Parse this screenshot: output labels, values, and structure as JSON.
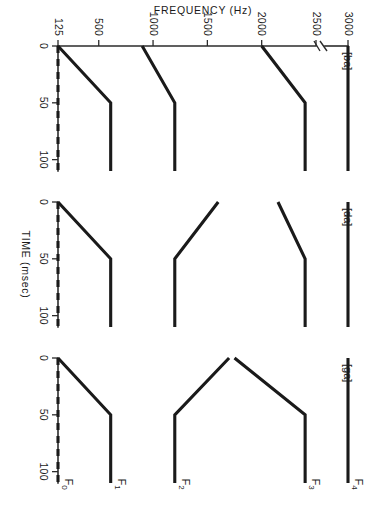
{
  "figure": {
    "orientation_deg": 90,
    "axis_titles": {
      "frequency": "FREQUENCY (Hz)",
      "time": "TIME (msec)"
    },
    "colors": {
      "ink": "#1a1a1a",
      "axis": "#2b2b2b",
      "background": "#ffffff"
    }
  },
  "axes": {
    "frequency": {
      "label": "FREQUENCY (Hz)",
      "unit": "Hz",
      "ticks": [
        125,
        500,
        1000,
        1500,
        2000,
        2500,
        3000
      ],
      "tick_labels": [
        "125",
        "500",
        "1000",
        "1500",
        "2000",
        "2500",
        "3000"
      ],
      "has_break": true,
      "break_between": [
        2500,
        3000
      ],
      "range": [
        125,
        3000
      ]
    },
    "time": {
      "label": "TIME (msec)",
      "unit": "msec",
      "ticks": [
        0,
        50,
        100
      ],
      "tick_labels": [
        "0",
        "50",
        "100"
      ],
      "range": [
        0,
        110
      ]
    }
  },
  "formant_labels": [
    {
      "name": "F0",
      "base": "F",
      "sub": "0"
    },
    {
      "name": "F1",
      "base": "F",
      "sub": "1"
    },
    {
      "name": "F2",
      "base": "F",
      "sub": "2"
    },
    {
      "name": "F3",
      "base": "F",
      "sub": "3"
    },
    {
      "name": "F4",
      "base": "F",
      "sub": "4"
    }
  ],
  "panels": [
    {
      "id": "ba",
      "label": "[ba]",
      "order": 1,
      "show_formant_labels": false,
      "traces": [
        {
          "formant": "F0",
          "style": "dashed",
          "points": [
            [
              0,
              125
            ],
            [
              110,
              125
            ]
          ]
        },
        {
          "formant": "F1",
          "style": "solid",
          "points": [
            [
              0,
              125
            ],
            [
              50,
              610
            ],
            [
              110,
              610
            ]
          ]
        },
        {
          "formant": "F2",
          "style": "solid",
          "points": [
            [
              0,
              900
            ],
            [
              50,
              1200
            ],
            [
              110,
              1200
            ]
          ]
        },
        {
          "formant": "F3",
          "style": "solid",
          "points": [
            [
              0,
              2000
            ],
            [
              50,
              2400
            ],
            [
              110,
              2400
            ]
          ]
        },
        {
          "formant": "F4",
          "style": "solid",
          "points": [
            [
              0,
              3000
            ],
            [
              110,
              3000
            ]
          ]
        }
      ]
    },
    {
      "id": "da",
      "label": "[da]",
      "order": 2,
      "show_formant_labels": false,
      "traces": [
        {
          "formant": "F0",
          "style": "dashed",
          "points": [
            [
              0,
              125
            ],
            [
              110,
              125
            ]
          ]
        },
        {
          "formant": "F1",
          "style": "solid",
          "points": [
            [
              0,
              125
            ],
            [
              50,
              610
            ],
            [
              110,
              610
            ]
          ]
        },
        {
          "formant": "F2",
          "style": "solid",
          "points": [
            [
              0,
              1600
            ],
            [
              50,
              1200
            ],
            [
              110,
              1200
            ]
          ]
        },
        {
          "formant": "F3",
          "style": "solid",
          "points": [
            [
              0,
              2150
            ],
            [
              50,
              2400
            ],
            [
              110,
              2400
            ]
          ]
        },
        {
          "formant": "F4",
          "style": "solid",
          "points": [
            [
              0,
              3000
            ],
            [
              110,
              3000
            ]
          ]
        }
      ]
    },
    {
      "id": "ga",
      "label": "[ga]",
      "order": 3,
      "show_formant_labels": true,
      "traces": [
        {
          "formant": "F0",
          "style": "dashed",
          "points": [
            [
              0,
              125
            ],
            [
              110,
              125
            ]
          ]
        },
        {
          "formant": "F1",
          "style": "solid",
          "points": [
            [
              0,
              125
            ],
            [
              50,
              610
            ],
            [
              110,
              610
            ]
          ]
        },
        {
          "formant": "F2",
          "style": "solid",
          "points": [
            [
              0,
              1700
            ],
            [
              50,
              1200
            ],
            [
              110,
              1200
            ]
          ]
        },
        {
          "formant": "F3",
          "style": "solid",
          "points": [
            [
              0,
              1750
            ],
            [
              50,
              2400
            ],
            [
              110,
              2400
            ]
          ]
        },
        {
          "formant": "F4",
          "style": "solid",
          "points": [
            [
              0,
              3000
            ],
            [
              110,
              3000
            ]
          ]
        }
      ]
    }
  ],
  "chart_data": {
    "type": "line",
    "title": "",
    "subtitle": "",
    "xlabel": "TIME (msec)",
    "ylabel": "FREQUENCY (Hz)",
    "xlim": [
      0,
      110
    ],
    "ylim": [
      125,
      3000
    ],
    "xticks": [
      0,
      50,
      100
    ],
    "yticks": [
      125,
      500,
      1000,
      1500,
      2000,
      2500,
      3000
    ],
    "grid": false,
    "legend": "none",
    "y_axis_break_between": [
      2500,
      3000
    ],
    "annotations": [
      "[ba]",
      "[da]",
      "[ga]",
      "F0",
      "F1",
      "F2",
      "F3",
      "F4"
    ],
    "panels": [
      {
        "name": "[ba]",
        "series": [
          {
            "name": "F0",
            "linestyle": "dashed",
            "x": [
              0,
              110
            ],
            "y": [
              125,
              125
            ]
          },
          {
            "name": "F1",
            "linestyle": "solid",
            "x": [
              0,
              50,
              110
            ],
            "y": [
              125,
              610,
              610
            ]
          },
          {
            "name": "F2",
            "linestyle": "solid",
            "x": [
              0,
              50,
              110
            ],
            "y": [
              900,
              1200,
              1200
            ]
          },
          {
            "name": "F3",
            "linestyle": "solid",
            "x": [
              0,
              50,
              110
            ],
            "y": [
              2000,
              2400,
              2400
            ]
          },
          {
            "name": "F4",
            "linestyle": "solid",
            "x": [
              0,
              110
            ],
            "y": [
              3000,
              3000
            ]
          }
        ]
      },
      {
        "name": "[da]",
        "series": [
          {
            "name": "F0",
            "linestyle": "dashed",
            "x": [
              0,
              110
            ],
            "y": [
              125,
              125
            ]
          },
          {
            "name": "F1",
            "linestyle": "solid",
            "x": [
              0,
              50,
              110
            ],
            "y": [
              125,
              610,
              610
            ]
          },
          {
            "name": "F2",
            "linestyle": "solid",
            "x": [
              0,
              50,
              110
            ],
            "y": [
              1600,
              1200,
              1200
            ]
          },
          {
            "name": "F3",
            "linestyle": "solid",
            "x": [
              0,
              50,
              110
            ],
            "y": [
              2150,
              2400,
              2400
            ]
          },
          {
            "name": "F4",
            "linestyle": "solid",
            "x": [
              0,
              110
            ],
            "y": [
              3000,
              3000
            ]
          }
        ]
      },
      {
        "name": "[ga]",
        "series": [
          {
            "name": "F0",
            "linestyle": "dashed",
            "x": [
              0,
              110
            ],
            "y": [
              125,
              125
            ]
          },
          {
            "name": "F1",
            "linestyle": "solid",
            "x": [
              0,
              50,
              110
            ],
            "y": [
              125,
              610,
              610
            ]
          },
          {
            "name": "F2",
            "linestyle": "solid",
            "x": [
              0,
              50,
              110
            ],
            "y": [
              1700,
              1200,
              1200
            ]
          },
          {
            "name": "F3",
            "linestyle": "solid",
            "x": [
              0,
              50,
              110
            ],
            "y": [
              1750,
              2400,
              2400
            ]
          },
          {
            "name": "F4",
            "linestyle": "solid",
            "x": [
              0,
              110
            ],
            "y": [
              3000,
              3000
            ]
          }
        ]
      }
    ]
  }
}
